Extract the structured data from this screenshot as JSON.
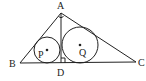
{
  "diagram": {
    "type": "geometry",
    "colors": {
      "stroke": "#222222",
      "background": "#ffffff"
    },
    "points": {
      "A": {
        "label": "A",
        "x": 61,
        "y": 13
      },
      "B": {
        "label": "B",
        "x": 20,
        "y": 63
      },
      "C": {
        "label": "C",
        "x": 136,
        "y": 62
      },
      "D": {
        "label": "D",
        "x": 61,
        "y": 63
      }
    },
    "circles": {
      "P": {
        "label": "P",
        "cx": 47,
        "cy": 50,
        "r": 13
      },
      "Q": {
        "label": "Q",
        "cx": 80,
        "cy": 45,
        "r": 18
      }
    },
    "right_angles": [
      "A",
      "D"
    ]
  }
}
